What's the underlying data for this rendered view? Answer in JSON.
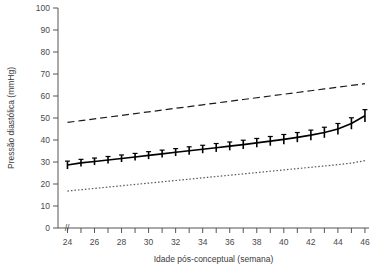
{
  "chart_data": {
    "type": "line",
    "title": "",
    "xlabel": "Idade pós-conceptual (semana)",
    "ylabel": "Pressão diastólica (mmHg)",
    "xlim": [
      23.3,
      46.3
    ],
    "ylim": [
      0,
      100
    ],
    "grid": false,
    "legend_position": "none",
    "axis_break": "//",
    "x_tick_step": 1,
    "x_label_step": 2,
    "y_tick_step": 10,
    "xticklabels": [
      "24",
      "26",
      "28",
      "30",
      "32",
      "34",
      "36",
      "38",
      "40",
      "42",
      "44",
      "46"
    ],
    "yticklabels": [
      "0",
      "10",
      "20",
      "30",
      "40",
      "50",
      "60",
      "70",
      "80",
      "90",
      "100"
    ],
    "x": [
      24,
      25,
      26,
      27,
      28,
      29,
      30,
      31,
      32,
      33,
      34,
      35,
      36,
      37,
      38,
      39,
      40,
      41,
      42,
      43,
      44,
      45,
      46
    ],
    "series": [
      {
        "name": "Percentil 97",
        "style": "dashed",
        "color": "#1a1a1a",
        "values": [
          48.0,
          48.8,
          49.6,
          50.4,
          51.2,
          52.0,
          52.8,
          53.6,
          54.4,
          55.2,
          56.0,
          56.8,
          57.6,
          58.4,
          59.2,
          60.0,
          60.8,
          61.6,
          62.4,
          63.2,
          64.0,
          64.8,
          65.6
        ]
      },
      {
        "name": "Média",
        "style": "solid",
        "color": "#000000",
        "values": [
          28.6,
          29.6,
          30.2,
          30.9,
          31.6,
          32.3,
          33.0,
          33.7,
          34.4,
          35.1,
          35.8,
          36.5,
          37.2,
          37.9,
          38.7,
          39.5,
          40.3,
          41.2,
          42.2,
          43.4,
          45.0,
          47.5,
          51.0
        ],
        "error_bars": [
          1.8,
          1.6,
          1.6,
          1.6,
          1.6,
          1.6,
          1.7,
          1.7,
          1.7,
          1.8,
          1.8,
          1.9,
          1.9,
          2.0,
          2.0,
          2.1,
          2.2,
          2.2,
          2.3,
          2.4,
          2.5,
          2.6,
          2.8
        ]
      },
      {
        "name": "Percentil 3",
        "style": "dotted",
        "color": "#555555",
        "values": [
          16.8,
          17.4,
          18.0,
          18.6,
          19.2,
          19.8,
          20.4,
          21.0,
          21.6,
          22.2,
          22.8,
          23.4,
          24.0,
          24.6,
          25.2,
          25.8,
          26.4,
          27.0,
          27.6,
          28.2,
          28.8,
          29.5,
          30.6
        ]
      }
    ]
  }
}
